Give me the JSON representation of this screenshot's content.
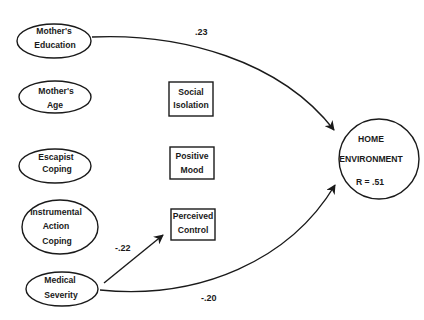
{
  "diagram": {
    "type": "path-diagram",
    "predictors": [
      {
        "id": "mothers-education",
        "lines": [
          "Mother's",
          "Education"
        ]
      },
      {
        "id": "mothers-age",
        "lines": [
          "Mother's",
          "Age"
        ]
      },
      {
        "id": "escapist-coping",
        "lines": [
          "Escapist",
          "Coping"
        ]
      },
      {
        "id": "instrumental-action-coping",
        "lines": [
          "Instrumental",
          "Action",
          "Coping"
        ]
      },
      {
        "id": "medical-severity",
        "lines": [
          "Medical",
          "Severity"
        ]
      }
    ],
    "mediators": [
      {
        "id": "social-isolation",
        "lines": [
          "Social",
          "Isolation"
        ]
      },
      {
        "id": "positive-mood",
        "lines": [
          "Positive",
          "Mood"
        ]
      },
      {
        "id": "perceived-control",
        "lines": [
          "Perceived",
          "Control"
        ]
      }
    ],
    "outcome": {
      "id": "home-environment",
      "lines": [
        "HOME",
        "ENVIRONMENT",
        "R = .51"
      ]
    },
    "paths": [
      {
        "from": "mothers-education",
        "to": "home-environment",
        "coefficient": ".23"
      },
      {
        "from": "medical-severity",
        "to": "perceived-control",
        "coefficient": "-.22"
      },
      {
        "from": "medical-severity",
        "to": "home-environment",
        "coefficient": "-.20"
      }
    ]
  }
}
